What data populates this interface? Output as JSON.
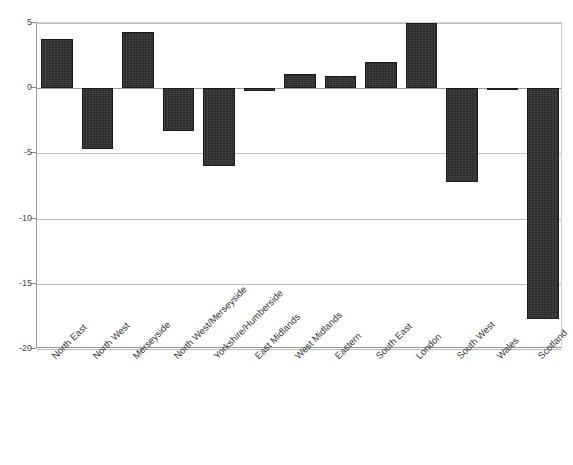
{
  "chart_data": {
    "type": "bar",
    "title": "",
    "xlabel": "",
    "ylabel": "",
    "ylim": [
      -20,
      5
    ],
    "yticks": [
      5,
      0,
      -5,
      -10,
      -15,
      -20
    ],
    "ytick_labels": [
      "5",
      "0",
      "-5",
      "-10",
      "-15",
      "-20"
    ],
    "grid": true,
    "legend": "none",
    "bar_color": "#2b2b2b",
    "categories": [
      "North East",
      "North West",
      "Merseyside",
      "North West/Merseyside",
      "Yorkshire/Humberside",
      "East Midlands",
      "West Midlands",
      "Eastern",
      "South East",
      "London",
      "South West",
      "Wales",
      "Scotland"
    ],
    "values": [
      3.8,
      -4.7,
      4.3,
      -3.3,
      -6.0,
      -0.2,
      1.1,
      0.9,
      2.0,
      5.0,
      -7.2,
      -0.15,
      -17.7
    ]
  }
}
